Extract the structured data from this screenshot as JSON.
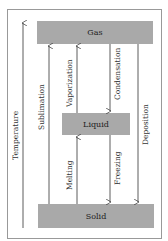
{
  "diagram": {
    "axis_label": "Temperature",
    "states": {
      "gas": "Gas",
      "liquid": "Liquid",
      "solid": "Solid"
    },
    "transitions": {
      "sublimation": "Sublimation",
      "vaporization": "Vaporization",
      "condensation": "Condensation",
      "deposition": "Deposition",
      "melting": "Melting",
      "freezing": "Freezing"
    },
    "colors": {
      "bar": "#a9a9a9",
      "line": "#333333"
    }
  }
}
